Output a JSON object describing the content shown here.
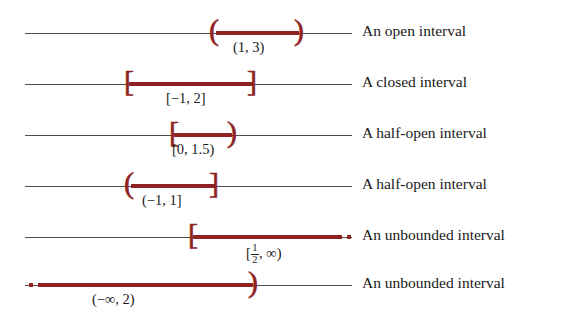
{
  "figure": {
    "line_color": "#4c4c4c",
    "interval_color": "#8f2222",
    "background": "#ffffff"
  },
  "rows": [
    {
      "id": "open-interval",
      "notation": "(1, 3)",
      "description": "An open interval",
      "left_endpoint": "(",
      "right_endpoint": ")",
      "left_bounded": true,
      "right_bounded": true,
      "axis_start": 25,
      "axis_end": 352,
      "seg_start": 216,
      "seg_end": 299,
      "line_y": 33,
      "caption_x": 233,
      "desc_x": 362
    },
    {
      "id": "closed-interval",
      "notation": "[−1, 2]",
      "description": "A closed interval",
      "left_endpoint": "[",
      "right_endpoint": "]",
      "left_bounded": true,
      "right_bounded": true,
      "axis_start": 25,
      "axis_end": 352,
      "seg_start": 129,
      "seg_end": 253,
      "line_y": 84,
      "caption_x": 166,
      "desc_x": 362
    },
    {
      "id": "half-open-interval-right",
      "notation": "[0, 1.5)",
      "description": "A half-open interval",
      "left_endpoint": "[",
      "right_endpoint": ")",
      "left_bounded": true,
      "right_bounded": true,
      "axis_start": 25,
      "axis_end": 352,
      "seg_start": 174,
      "seg_end": 232,
      "line_y": 135,
      "caption_x": 172,
      "desc_x": 362
    },
    {
      "id": "half-open-interval-left",
      "notation": "(−1, 1]",
      "description": "A half-open interval",
      "left_endpoint": "(",
      "right_endpoint": "]",
      "left_bounded": true,
      "right_bounded": true,
      "axis_start": 25,
      "axis_end": 352,
      "seg_start": 131,
      "seg_end": 215,
      "line_y": 186,
      "caption_x": 142,
      "desc_x": 362
    },
    {
      "id": "unbounded-interval-right",
      "notation_prefix": "[",
      "notation_numerator": "1",
      "notation_denominator": "2",
      "notation_suffix": ", ∞)",
      "description": "An unbounded interval",
      "left_endpoint": "[",
      "right_endpoint": "",
      "left_bounded": true,
      "right_bounded": false,
      "axis_start": 25,
      "axis_end": 352,
      "seg_start": 193,
      "seg_end": 338,
      "dots_start": 338,
      "dots_end": 356,
      "line_y": 237,
      "caption_x": 246,
      "desc_x": 362
    },
    {
      "id": "unbounded-interval-left",
      "notation": "(−∞, 2)",
      "description": "An unbounded interval",
      "left_endpoint": "",
      "right_endpoint": ")",
      "left_bounded": false,
      "right_bounded": true,
      "axis_start": 25,
      "axis_end": 352,
      "seg_start": 42,
      "seg_end": 253,
      "dots_start": 24,
      "dots_end": 42,
      "line_y": 285,
      "caption_x": 92,
      "desc_x": 362
    }
  ]
}
